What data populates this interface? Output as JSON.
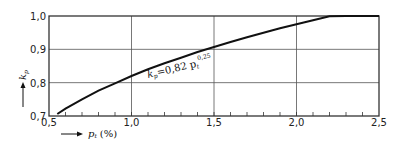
{
  "chart_data": {
    "type": "line",
    "title": "",
    "xlabel": "p_t (%)",
    "ylabel": "k_p",
    "xlim": [
      0.5,
      2.5
    ],
    "ylim": [
      0.7,
      1.0
    ],
    "x_ticks": [
      "0,5",
      "1,0",
      "1,5",
      "2,0",
      "2,5"
    ],
    "y_ticks": [
      "0,7",
      "0,8",
      "0,9",
      "1,0"
    ],
    "grid": true,
    "legend": null,
    "annotation": "k_p = 0,82 p_t^0,25",
    "series": [
      {
        "name": "k_p = 0.82 p_t^0.25",
        "x": [
          0.55,
          0.6,
          0.7,
          0.8,
          0.9,
          1.0,
          1.1,
          1.2,
          1.3,
          1.4,
          1.5,
          1.6,
          1.7,
          1.8,
          1.9,
          2.0,
          2.1,
          2.2,
          2.3,
          2.4,
          2.5
        ],
        "values": [
          0.706,
          0.722,
          0.75,
          0.776,
          0.798,
          0.82,
          0.84,
          0.858,
          0.875,
          0.892,
          0.907,
          0.922,
          0.936,
          0.95,
          0.963,
          0.975,
          0.987,
          0.999,
          1.01,
          1.021,
          1.031
        ]
      }
    ]
  },
  "labels": {
    "x_axis_symbol": "p",
    "x_axis_subscript": "t",
    "x_axis_unit": "(%)",
    "y_axis_symbol": "k",
    "y_axis_subscript": "p",
    "equation_lhs": "k",
    "equation_lhs_sub": "p",
    "equation_rhs": "=0,82 p",
    "equation_rhs_sub": "t",
    "equation_exp": "0,25"
  }
}
